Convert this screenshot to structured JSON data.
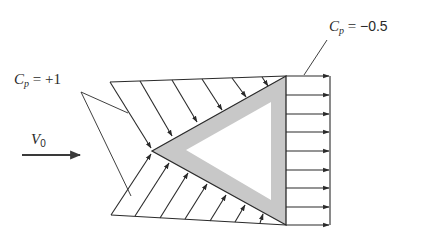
{
  "diagram": {
    "labels": {
      "cp_front": {
        "symbol": "C",
        "subscript": "p",
        "equals": " = ",
        "value": "+1"
      },
      "cp_back": {
        "symbol": "C",
        "subscript": "p",
        "equals": " = ",
        "value": "−0.5"
      },
      "freestream": {
        "symbol": "V",
        "subscript": "0"
      }
    },
    "colors": {
      "stroke": "#2a2a2a",
      "wall_fill": "#c8c8c8",
      "background": "#ffffff"
    },
    "geometry": {
      "outer_triangle": [
        [
          152,
          151
        ],
        [
          286,
          76
        ],
        [
          286,
          225
        ]
      ],
      "inner_triangle": [
        [
          186,
          150
        ],
        [
          271,
          102
        ],
        [
          271,
          200
        ]
      ],
      "front_envelope_top": [
        [
          110,
          82
        ],
        [
          286,
          76
        ]
      ],
      "front_envelope_bottom": [
        [
          111,
          215
        ],
        [
          286,
          225
        ]
      ],
      "back_envelope_x": 330,
      "freestream_arrow": [
        [
          22,
          155
        ],
        [
          80,
          155
        ]
      ]
    }
  }
}
